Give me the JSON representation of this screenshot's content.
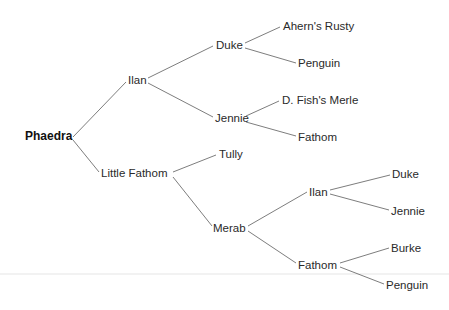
{
  "diagram": {
    "type": "pedigree-tree",
    "root": "Phaedra",
    "nodes": [
      {
        "id": "n0",
        "label": "Phaedra",
        "generation": 0,
        "x": 25,
        "y": 136,
        "bold": true
      },
      {
        "id": "n1",
        "label": "Ilan",
        "generation": 1,
        "x": 128,
        "y": 80
      },
      {
        "id": "n2",
        "label": "Little Fathom",
        "generation": 1,
        "x": 101,
        "y": 173
      },
      {
        "id": "n3",
        "label": "Duke",
        "generation": 2,
        "x": 216,
        "y": 45
      },
      {
        "id": "n4",
        "label": "Jennie",
        "generation": 2,
        "x": 215,
        "y": 118
      },
      {
        "id": "n5",
        "label": "Tully",
        "generation": 2,
        "x": 219,
        "y": 154
      },
      {
        "id": "n6",
        "label": "Merab",
        "generation": 2,
        "x": 213,
        "y": 228
      },
      {
        "id": "n7",
        "label": "Ahern's Rusty",
        "generation": 3,
        "x": 283,
        "y": 26
      },
      {
        "id": "n8",
        "label": "Penguin",
        "generation": 3,
        "x": 298,
        "y": 63
      },
      {
        "id": "n9",
        "label": "D. Fish's Merle",
        "generation": 3,
        "x": 282,
        "y": 100
      },
      {
        "id": "n10",
        "label": "Fathom",
        "generation": 3,
        "x": 298,
        "y": 137
      },
      {
        "id": "n11",
        "label": "Ilan",
        "generation": 3,
        "x": 309,
        "y": 192
      },
      {
        "id": "n12",
        "label": "Fathom",
        "generation": 3,
        "x": 298,
        "y": 265
      },
      {
        "id": "n13",
        "label": "Duke",
        "generation": 4,
        "x": 392,
        "y": 174
      },
      {
        "id": "n14",
        "label": "Jennie",
        "generation": 4,
        "x": 391,
        "y": 211
      },
      {
        "id": "n15",
        "label": "Burke",
        "generation": 4,
        "x": 391,
        "y": 248
      },
      {
        "id": "n16",
        "label": "Penguin",
        "generation": 4,
        "x": 386,
        "y": 285
      }
    ],
    "edges": [
      {
        "from": "n0",
        "to": "n1"
      },
      {
        "from": "n0",
        "to": "n2"
      },
      {
        "from": "n1",
        "to": "n3"
      },
      {
        "from": "n1",
        "to": "n4"
      },
      {
        "from": "n2",
        "to": "n5"
      },
      {
        "from": "n2",
        "to": "n6"
      },
      {
        "from": "n3",
        "to": "n7"
      },
      {
        "from": "n3",
        "to": "n8"
      },
      {
        "from": "n4",
        "to": "n9"
      },
      {
        "from": "n4",
        "to": "n10"
      },
      {
        "from": "n6",
        "to": "n11"
      },
      {
        "from": "n6",
        "to": "n12"
      },
      {
        "from": "n11",
        "to": "n13"
      },
      {
        "from": "n11",
        "to": "n14"
      },
      {
        "from": "n12",
        "to": "n15"
      },
      {
        "from": "n12",
        "to": "n16"
      }
    ]
  },
  "colors": {
    "line": "#6e6e6e",
    "text": "#2a2a2a",
    "background": "#ffffff"
  }
}
